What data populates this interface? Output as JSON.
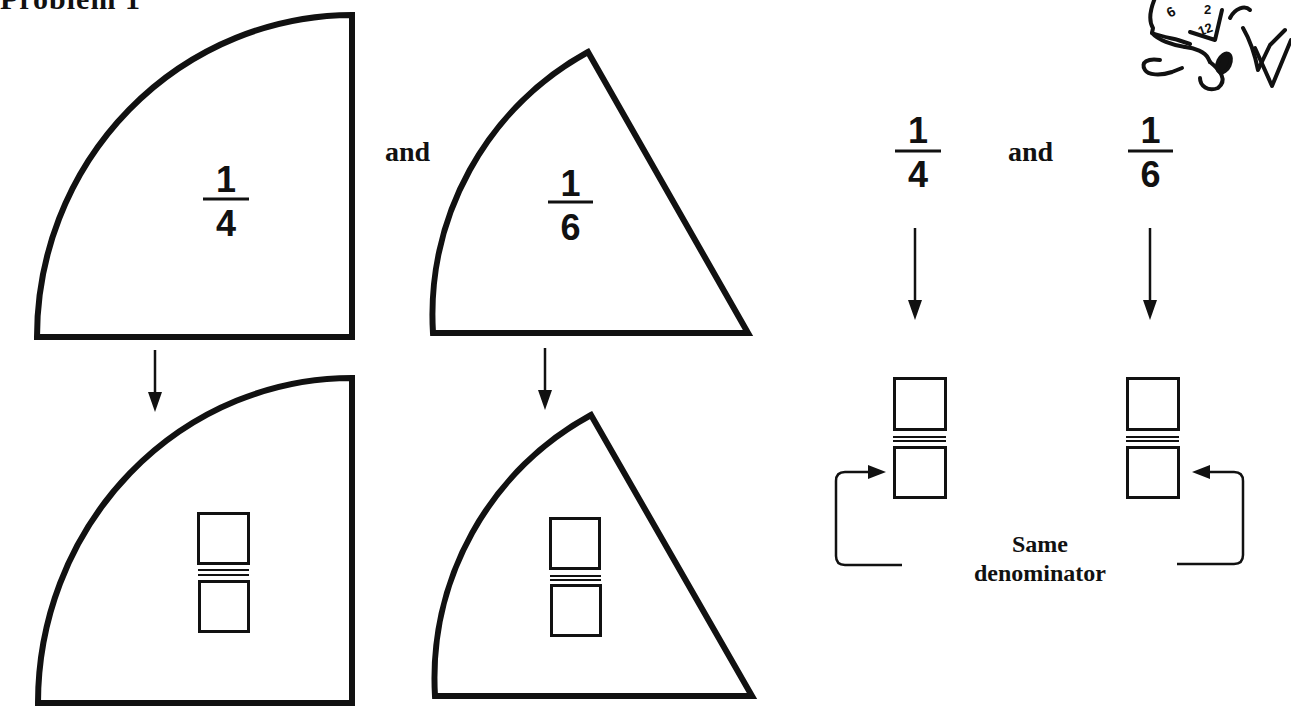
{
  "title": "Problem 1",
  "colors": {
    "ink": "#111111",
    "paper": "#ffffff"
  },
  "top_row": {
    "quarter_sector": {
      "numerator": "1",
      "denominator": "4"
    },
    "connector_word": "and",
    "sixth_sector": {
      "numerator": "1",
      "denominator": "6"
    }
  },
  "bottom_row": {
    "quarter_sector": {
      "numerator_box": "",
      "denominator_box": ""
    },
    "sixth_sector": {
      "numerator_box": "",
      "denominator_box": ""
    }
  },
  "right_panel": {
    "left_fraction": {
      "numerator": "1",
      "denominator": "4"
    },
    "connector_word": "and",
    "right_fraction": {
      "numerator": "1",
      "denominator": "6"
    },
    "note_line1": "Same",
    "note_line2": "denominator"
  },
  "mascot": {
    "icon": "cartoon-mascot-icon",
    "labels": [
      "6",
      "2",
      "12"
    ]
  }
}
